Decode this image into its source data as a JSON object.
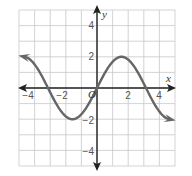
{
  "chart_data": {
    "type": "line",
    "title": "",
    "xlabel": "x",
    "ylabel": "y",
    "xlim": [
      -5,
      5
    ],
    "ylim": [
      -5,
      5
    ],
    "grid": true,
    "x_ticks": [
      "-4",
      "-2",
      "2",
      "4"
    ],
    "y_ticks": [
      "4",
      "2",
      "-2",
      "-4"
    ],
    "origin_label": "O",
    "series": [
      {
        "name": "y = 2 sin x",
        "x": [
          -4.6,
          -3.14,
          -1.57,
          0,
          1.57,
          3.14,
          4.6
        ],
        "values": [
          1.99,
          0,
          -2,
          0,
          2,
          0,
          -1.99
        ],
        "color": "#666666",
        "arrows_both_ends": true
      }
    ]
  },
  "labels": {
    "x_axis": "x",
    "y_axis": "y",
    "origin": "O",
    "xt_m4": "−4",
    "xt_m2": "−2",
    "xt_2": "2",
    "xt_4": "4",
    "yt_4": "4",
    "yt_2": "2",
    "yt_m2": "−2",
    "yt_m4": "−4"
  }
}
